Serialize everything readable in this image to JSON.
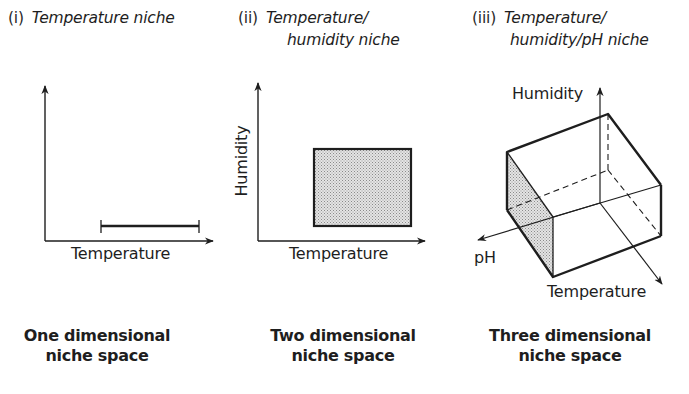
{
  "colors": {
    "ink": "#1e1e1e",
    "shade": "#cfcfcf",
    "background": "#ffffff"
  },
  "panels": [
    {
      "numeral": "(i)",
      "title_lines": [
        "Temperature niche"
      ],
      "axes": {
        "x": "Temperature",
        "y": ""
      },
      "caption_lines": [
        "One dimensional",
        "niche space"
      ]
    },
    {
      "numeral": "(ii)",
      "title_lines": [
        "Temperature/",
        "humidity niche"
      ],
      "axes": {
        "x": "Temperature",
        "y": "Humidity"
      },
      "caption_lines": [
        "Two dimensional",
        "niche space"
      ]
    },
    {
      "numeral": "(iii)",
      "title_lines": [
        "Temperature/",
        "humidity/pH niche"
      ],
      "axes": {
        "x": "Temperature",
        "y": "Humidity",
        "z": "pH"
      },
      "caption_lines": [
        "Three dimensional",
        "niche space"
      ]
    }
  ]
}
